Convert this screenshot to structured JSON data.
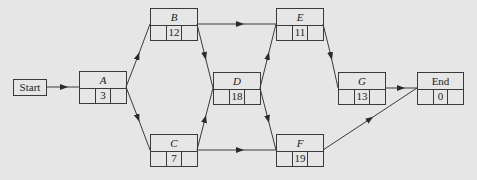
{
  "diagram": {
    "type": "activity-on-node network",
    "start": {
      "label": "Start"
    },
    "nodes": [
      {
        "id": "A",
        "label": "A",
        "duration": "3"
      },
      {
        "id": "B",
        "label": "B",
        "duration": "12"
      },
      {
        "id": "C",
        "label": "C",
        "duration": "7"
      },
      {
        "id": "D",
        "label": "D",
        "duration": "18"
      },
      {
        "id": "E",
        "label": "E",
        "duration": "11"
      },
      {
        "id": "F",
        "label": "F",
        "duration": "19"
      },
      {
        "id": "G",
        "label": "G",
        "duration": "13"
      },
      {
        "id": "End",
        "label": "End",
        "duration": "0"
      }
    ],
    "edges": [
      [
        "Start",
        "A"
      ],
      [
        "A",
        "B"
      ],
      [
        "A",
        "C"
      ],
      [
        "B",
        "D"
      ],
      [
        "C",
        "D"
      ],
      [
        "B",
        "E"
      ],
      [
        "C",
        "F"
      ],
      [
        "D",
        "E"
      ],
      [
        "D",
        "F"
      ],
      [
        "E",
        "G"
      ],
      [
        "G",
        "End"
      ],
      [
        "F",
        "End"
      ]
    ],
    "colors": {
      "background": "#e6e6e6",
      "line": "#3a3a3a",
      "text": "#222222"
    }
  }
}
